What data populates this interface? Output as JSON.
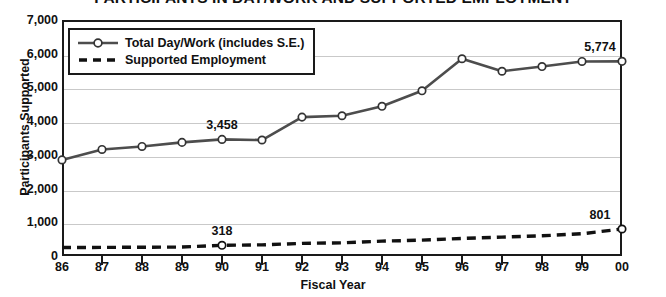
{
  "chart_data": {
    "type": "line",
    "title": "PARTICIPANTS IN DAY/WORK AND SUPPORTED EMPLOYMENT",
    "xlabel": "Fiscal Year",
    "ylabel": "Participants Supported",
    "categories": [
      "86",
      "87",
      "88",
      "89",
      "90",
      "91",
      "92",
      "93",
      "94",
      "95",
      "96",
      "97",
      "98",
      "99",
      "00"
    ],
    "ylim": [
      0,
      7000
    ],
    "ytick_labels": [
      "0",
      "1,000",
      "2,000",
      "3,000",
      "4,000",
      "5,000",
      "6,000",
      "7,000"
    ],
    "ytick_values": [
      0,
      1000,
      2000,
      3000,
      4000,
      5000,
      6000,
      7000
    ],
    "grid": true,
    "legend_position": "top-left",
    "series": [
      {
        "name": "Total Day/Work (includes S.E.)",
        "style": "solid",
        "marker": "open-circle",
        "color": "#4d4d4d",
        "values": [
          2850,
          3160,
          3250,
          3370,
          3458,
          3440,
          4120,
          4160,
          4440,
          4900,
          5850,
          5480,
          5620,
          5770,
          5774
        ]
      },
      {
        "name": "Supported Employment",
        "style": "dashed",
        "marker": "open-circle-labeled",
        "color": "#111111",
        "values": [
          250,
          255,
          260,
          265,
          318,
          330,
          375,
          390,
          440,
          470,
          520,
          560,
          600,
          660,
          801
        ]
      }
    ],
    "point_labels": [
      {
        "series": 0,
        "category": "90",
        "text": "3,458",
        "position": "above"
      },
      {
        "series": 0,
        "category": "00",
        "text": "5,774",
        "position": "above"
      },
      {
        "series": 1,
        "category": "90",
        "text": "318",
        "position": "above"
      },
      {
        "series": 1,
        "category": "00",
        "text": "801",
        "position": "above"
      }
    ]
  },
  "legend": {
    "items": [
      {
        "label": "Total Day/Work (includes S.E.)"
      },
      {
        "label": "Supported Employment"
      }
    ]
  }
}
